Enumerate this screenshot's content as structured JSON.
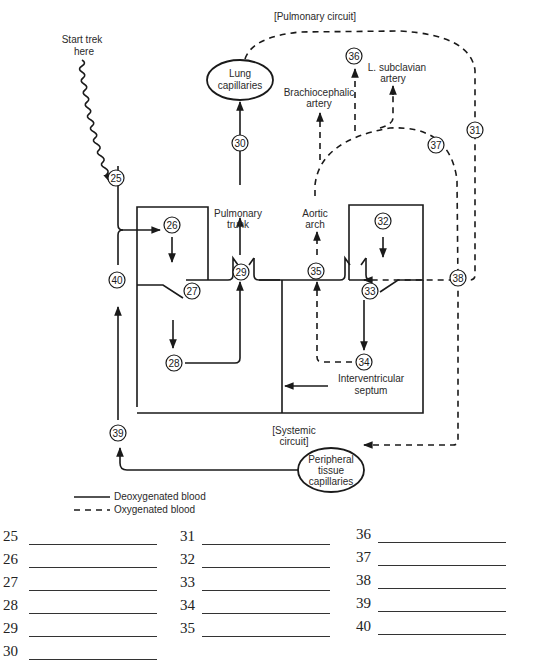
{
  "labels": {
    "pulmonary_circuit": "[Pulmonary circuit]",
    "start_line1": "Start trek",
    "start_line2": "here",
    "lung_line1": "Lung",
    "lung_line2": "capillaries",
    "brachio_line1": "Brachiocephalic",
    "brachio_line2": "artery",
    "lsub_line1": "L. subclavian",
    "lsub_line2": "artery",
    "pulm_trunk_line1": "Pulmonary",
    "pulm_trunk_line2": "trunk",
    "aortic_line1": "Aortic",
    "aortic_line2": "arch",
    "septum_line1": "Interventricular",
    "septum_line2": "septum",
    "systemic_line1": "[Systemic",
    "systemic_line2": "circuit]",
    "periph_line1": "Peripheral",
    "periph_line2": "tissue",
    "periph_line3": "capillaries"
  },
  "markers": {
    "m25": "25",
    "m26": "26",
    "m27": "27",
    "m28": "28",
    "m29": "29",
    "m30": "30",
    "m31": "31",
    "m32": "32",
    "m33": "33",
    "m34": "34",
    "m35": "35",
    "m36": "36",
    "m37": "37",
    "m38": "38",
    "m39": "39",
    "m40": "40"
  },
  "legend": {
    "solid": "Deoxygenated blood",
    "dashed": "Oxygenated blood"
  },
  "answers": {
    "col1": [
      {
        "number": "25",
        "value": ""
      },
      {
        "number": "26",
        "value": ""
      },
      {
        "number": "27",
        "value": ""
      },
      {
        "number": "28",
        "value": ""
      },
      {
        "number": "29",
        "value": ""
      },
      {
        "number": "30",
        "value": ""
      }
    ],
    "col2": [
      {
        "number": "31",
        "value": ""
      },
      {
        "number": "32",
        "value": ""
      },
      {
        "number": "33",
        "value": ""
      },
      {
        "number": "34",
        "value": ""
      },
      {
        "number": "35",
        "value": ""
      }
    ],
    "col3": [
      {
        "number": "36",
        "value": ""
      },
      {
        "number": "37",
        "value": ""
      },
      {
        "number": "38",
        "value": ""
      },
      {
        "number": "39",
        "value": ""
      },
      {
        "number": "40",
        "value": ""
      }
    ]
  }
}
